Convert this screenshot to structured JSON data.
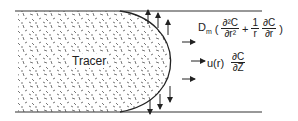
{
  "diagram": {
    "type": "tube-flow-tracer",
    "tracer_label": "Tracer",
    "colors": {
      "line": "#333333",
      "fill": "#ffffff",
      "speckle": "#555555"
    },
    "radial_term": {
      "coefficient": "D",
      "coefficient_sub": "m",
      "open": "(",
      "frac1_num": "∂²C",
      "frac1_den": "∂r²",
      "plus": "+",
      "frac2_num": "1",
      "frac2_den": "r",
      "frac3_num": "∂C",
      "frac3_den": "∂r",
      "close": ")"
    },
    "axial_term": {
      "velocity": "u(r)",
      "frac_num": "∂C",
      "frac_den": "∂Z"
    },
    "arrows": {
      "radial_up": 3,
      "radial_down": 3,
      "axial_right": 3
    }
  }
}
